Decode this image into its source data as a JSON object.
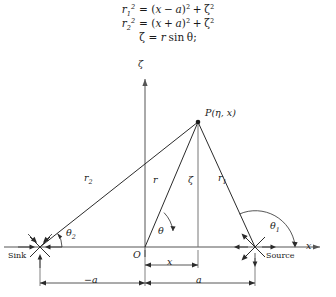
{
  "equations": {
    "line1": {
      "lhs_base": "r",
      "lhs_sub": "1",
      "lhs_sup": "2",
      "eq": "=",
      "open": "(",
      "term1": "x",
      "op": "−",
      "term2": "a",
      "close": ")",
      "close_sup": "2",
      "plus": "+",
      "last": "ζ",
      "last_sup": "2",
      "plain": "r₁² = (x − a)² + ζ²"
    },
    "line2": {
      "lhs_base": "r",
      "lhs_sub": "2",
      "lhs_sup": "2",
      "eq": "=",
      "open": "(",
      "term1": "x",
      "op": "+",
      "term2": "a",
      "close": ")",
      "close_sup": "2",
      "plus": "+",
      "last": "ζ",
      "last_sup": "2",
      "plain": "r₂² = (x + a)² + ζ²"
    },
    "line3": {
      "lhs": "ζ",
      "eq": "=",
      "rhs_r": "r",
      "rhs_sin": "sin",
      "rhs_theta": "θ",
      "semicolon": ";",
      "plain": "ζ = r sin θ;"
    }
  },
  "figure": {
    "axes": {
      "x_axis_label": "x",
      "zeta_axis_label": "ζ",
      "origin_label": "O"
    },
    "points": {
      "p_label_base": "P",
      "p_label_args": "(η, x)",
      "p_label_full": "P(η, x)",
      "sink_label": "Sink",
      "source_label": "Source"
    },
    "segments": [
      {
        "name": "r2",
        "base": "r",
        "sub": "2"
      },
      {
        "name": "r",
        "base": "r",
        "sub": ""
      },
      {
        "name": "zeta",
        "base": "ζ",
        "sub": ""
      },
      {
        "name": "r1",
        "base": "r",
        "sub": "1"
      }
    ],
    "angles": [
      {
        "name": "theta2",
        "base": "θ",
        "sub": "2"
      },
      {
        "name": "theta",
        "base": "θ",
        "sub": ""
      },
      {
        "name": "theta1",
        "base": "θ",
        "sub": "1"
      }
    ],
    "dimensions": [
      {
        "name": "minus-a",
        "label": "−a"
      },
      {
        "name": "x",
        "label": "x"
      },
      {
        "name": "a",
        "label": "a"
      }
    ],
    "colors": {
      "line": "#2b2b2b",
      "axis": "#555555",
      "background": "#ffffff"
    }
  }
}
